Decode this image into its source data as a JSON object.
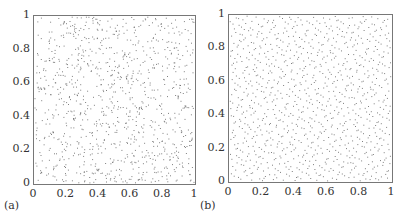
{
  "chart_data": [
    {
      "type": "scatter",
      "title": "",
      "panel_label": "(a)",
      "description": "Pseudo-random uniform point set in unit square (clustered, with gaps)",
      "xlabel": "",
      "ylabel": "",
      "xlim": [
        0,
        1
      ],
      "ylim": [
        0,
        1
      ],
      "xticks": [
        "0",
        "0.2",
        "0.4",
        "0.6",
        "0.8",
        "1"
      ],
      "yticks": [
        "0",
        "0.2",
        "0.4",
        "0.6",
        "0.8",
        "1"
      ],
      "n_points_approx": 1000,
      "distribution": "random",
      "grid": false
    },
    {
      "type": "scatter",
      "title": "",
      "panel_label": "(b)",
      "description": "Low-discrepancy (quasi-random) point set in unit square (evenly spread)",
      "xlabel": "",
      "ylabel": "",
      "xlim": [
        0,
        1
      ],
      "ylim": [
        0,
        1
      ],
      "xticks": [
        "0",
        "0.2",
        "0.4",
        "0.6",
        "0.8",
        "1"
      ],
      "yticks": [
        "0",
        "0.2",
        "0.4",
        "0.6",
        "0.8",
        "1"
      ],
      "n_points_approx": 1000,
      "distribution": "quasi-random",
      "grid": false
    }
  ],
  "colors": {
    "points": "#555555",
    "axes": "#777777",
    "text": "#333333"
  }
}
